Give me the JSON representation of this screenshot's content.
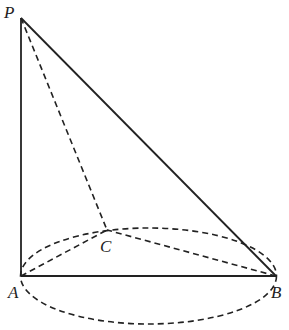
{
  "diagram": {
    "type": "geometry",
    "points": {
      "P": {
        "label": "P",
        "x": 21,
        "y": 18
      },
      "A": {
        "label": "A",
        "x": 21,
        "y": 276
      },
      "B": {
        "label": "B",
        "x": 276,
        "y": 276
      },
      "C": {
        "label": "C",
        "x": 107,
        "y": 230
      }
    },
    "solid_segments": [
      "PA",
      "PB",
      "AB"
    ],
    "dashed_segments": [
      "PC",
      "AC",
      "BC"
    ],
    "ellipse": {
      "cx": 148.5,
      "cy": 276,
      "rx": 128,
      "ry": 48,
      "style": "dashed"
    },
    "stroke_color": "#222222"
  }
}
